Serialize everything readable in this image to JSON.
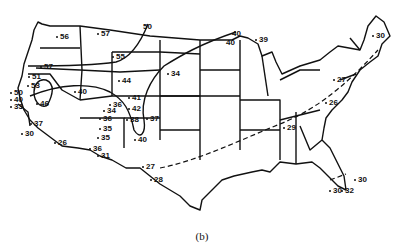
{
  "figure": {
    "caption": "(b)"
  },
  "stations": [
    {
      "value": "56",
      "x": 60,
      "y": 33
    },
    {
      "value": "57",
      "x": 101,
      "y": 30
    },
    {
      "value": "57",
      "x": 44,
      "y": 63
    },
    {
      "value": "55",
      "x": 116,
      "y": 53
    },
    {
      "value": "51",
      "x": 32,
      "y": 73
    },
    {
      "value": "53",
      "x": 31,
      "y": 82
    },
    {
      "value": "44",
      "x": 122,
      "y": 77
    },
    {
      "value": "34",
      "x": 171,
      "y": 70
    },
    {
      "value": "39",
      "x": 259,
      "y": 36
    },
    {
      "value": "50",
      "x": 14,
      "y": 89
    },
    {
      "value": "40",
      "x": 14,
      "y": 96
    },
    {
      "value": "33",
      "x": 14,
      "y": 103
    },
    {
      "value": "46",
      "x": 40,
      "y": 100
    },
    {
      "value": "40",
      "x": 78,
      "y": 88
    },
    {
      "value": "37",
      "x": 34,
      "y": 120
    },
    {
      "value": "30",
      "x": 25,
      "y": 130
    },
    {
      "value": "26",
      "x": 58,
      "y": 139
    },
    {
      "value": "34",
      "x": 107,
      "y": 107
    },
    {
      "value": "36",
      "x": 113,
      "y": 101
    },
    {
      "value": "36",
      "x": 103,
      "y": 115
    },
    {
      "value": "41",
      "x": 132,
      "y": 94
    },
    {
      "value": "42",
      "x": 132,
      "y": 105
    },
    {
      "value": "38",
      "x": 130,
      "y": 116
    },
    {
      "value": "37",
      "x": 150,
      "y": 115
    },
    {
      "value": "40",
      "x": 138,
      "y": 136
    },
    {
      "value": "35",
      "x": 103,
      "y": 125
    },
    {
      "value": "35",
      "x": 101,
      "y": 134
    },
    {
      "value": "36",
      "x": 93,
      "y": 145
    },
    {
      "value": "31",
      "x": 101,
      "y": 152
    },
    {
      "value": "27",
      "x": 146,
      "y": 163
    },
    {
      "value": "28",
      "x": 154,
      "y": 176
    },
    {
      "value": "27",
      "x": 337,
      "y": 76
    },
    {
      "value": "26",
      "x": 329,
      "y": 99
    },
    {
      "value": "29",
      "x": 287,
      "y": 124
    },
    {
      "value": "30",
      "x": 358,
      "y": 176
    },
    {
      "value": "30",
      "x": 333,
      "y": 187
    },
    {
      "value": "32",
      "x": 345,
      "y": 187
    },
    {
      "value": "30",
      "x": 376,
      "y": 32
    }
  ],
  "contour_labels": [
    {
      "value": "50",
      "x": 143,
      "y": 23
    },
    {
      "value": "40",
      "x": 232,
      "y": 30
    },
    {
      "value": "40",
      "x": 226,
      "y": 39
    }
  ]
}
